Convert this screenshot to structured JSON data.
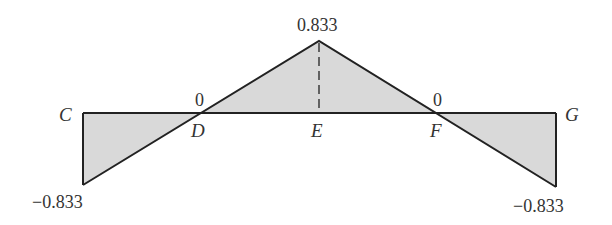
{
  "diagram": {
    "type": "influence-line",
    "baseline_y": 0,
    "points": {
      "C": {
        "label": "C",
        "value": "-0.833"
      },
      "D": {
        "label": "D",
        "value": "0"
      },
      "E": {
        "label": "E",
        "value": "0.833"
      },
      "F": {
        "label": "F",
        "value": "0"
      },
      "G": {
        "label": "G",
        "value": "-0.833"
      }
    },
    "value_labels": {
      "peak": "0.833",
      "zero_left": "0",
      "zero_right": "0",
      "left_end": "−0.833",
      "right_end": "−0.833"
    },
    "colors": {
      "line": "#222222",
      "fill": "#d9d9d9",
      "text": "#333333"
    }
  }
}
